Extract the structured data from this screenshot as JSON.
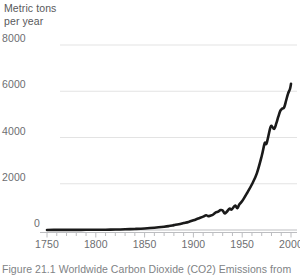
{
  "figure": {
    "axis_title": "Metric tons\nper year",
    "caption": "Figure 21.1 Worldwide Carbon Dioxide (CO2) Emissions from",
    "colors": {
      "line": "#1a1a1a",
      "grid": "#e3e3e3",
      "axis": "#bcbdc0",
      "tick_text": "#6d6e71",
      "title_text": "#58595b",
      "caption_text": "#808285",
      "background": "#ffffff"
    }
  },
  "chart_data": {
    "type": "line",
    "title": "",
    "subtitle": "",
    "xlabel": "",
    "ylabel": "Metric tons per year",
    "xlim": [
      1740,
      2005
    ],
    "ylim": [
      0,
      8000
    ],
    "grid": true,
    "legend": false,
    "yticks": [
      0,
      2000,
      4000,
      6000,
      8000
    ],
    "ytick_labels": [
      "0",
      "2000",
      "4000",
      "6000",
      "8000"
    ],
    "xticks": [
      1750,
      1800,
      1850,
      1900,
      1950,
      2000
    ],
    "xtick_labels": [
      "1750",
      "1800",
      "1850",
      "1900",
      "1950",
      "2000"
    ],
    "xminor_step": 10,
    "series": [
      {
        "name": "Worldwide CO2 emissions",
        "x": [
          1750,
          1760,
          1770,
          1780,
          1790,
          1800,
          1810,
          1820,
          1830,
          1840,
          1850,
          1860,
          1870,
          1875,
          1880,
          1885,
          1890,
          1895,
          1900,
          1905,
          1910,
          1913,
          1915,
          1918,
          1920,
          1923,
          1925,
          1928,
          1930,
          1932,
          1934,
          1937,
          1939,
          1941,
          1943,
          1945,
          1947,
          1950,
          1955,
          1960,
          1965,
          1970,
          1973,
          1975,
          1979,
          1981,
          1983,
          1985,
          1987,
          1989,
          1991,
          1993,
          1995,
          1997,
          1999,
          2000
        ],
        "y": [
          3,
          4,
          5,
          6,
          8,
          10,
          14,
          20,
          30,
          45,
          65,
          95,
          140,
          170,
          210,
          250,
          300,
          350,
          420,
          500,
          580,
          640,
          600,
          630,
          660,
          760,
          790,
          860,
          840,
          720,
          780,
          920,
          880,
          980,
          1060,
          940,
          1100,
          1250,
          1600,
          1980,
          2450,
          3200,
          3750,
          3750,
          4450,
          4450,
          4380,
          4620,
          4900,
          5150,
          5250,
          5300,
          5600,
          5900,
          6100,
          6320
        ]
      }
    ],
    "annotations": [
      {
        "label": "near-zero baseline before 1850"
      },
      {
        "label": "dip around 1930 (Great Depression)"
      },
      {
        "label": "fluctuation around 1940s (World War II)"
      },
      {
        "label": "steep rise 1950-1980"
      },
      {
        "label": "plateau and oscillation 1979-1990"
      }
    ]
  }
}
